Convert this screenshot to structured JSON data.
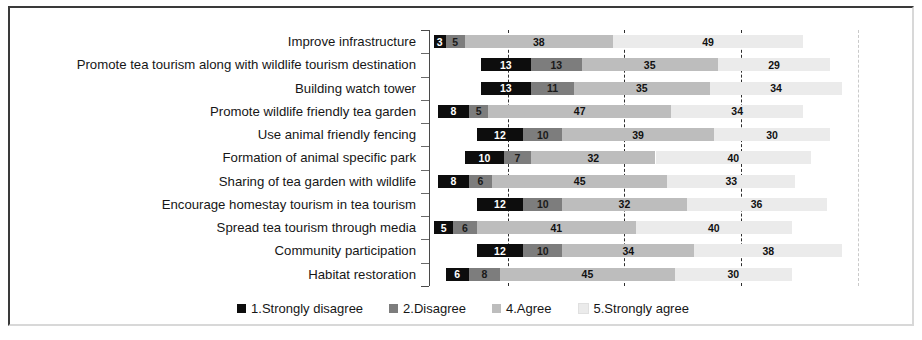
{
  "chart_data": {
    "type": "bar",
    "subtype": "stacked-horizontal",
    "title": "",
    "xlabel": "",
    "ylabel": "",
    "grid": true,
    "legend_position": "bottom",
    "xlim": [
      0,
      100
    ],
    "categories": [
      "Improve infrastructure",
      "Promote tea tourism along with wildlife tourism destination",
      "Building watch tower",
      "Promote wildlife friendly tea garden",
      "Use animal friendly fencing",
      "Formation of animal specific park",
      "Sharing of tea garden with wildlife",
      "Encourage homestay tourism in tea tourism",
      "Spread tea tourism through media",
      "Community participation",
      "Habitat restoration"
    ],
    "series": [
      {
        "name": "1.Strongly disagree",
        "color": "#0d0d0d",
        "values": [
          3,
          13,
          13,
          8,
          12,
          10,
          8,
          12,
          5,
          12,
          6
        ]
      },
      {
        "name": "2.Disagree",
        "color": "#7d7d7d",
        "values": [
          5,
          13,
          11,
          5,
          10,
          7,
          6,
          10,
          6,
          10,
          8
        ]
      },
      {
        "name": "4.Agree",
        "color": "#bdbdbd",
        "values": [
          38,
          35,
          35,
          47,
          39,
          32,
          45,
          32,
          41,
          34,
          45
        ]
      },
      {
        "name": "5.Strongly agree",
        "color": "#ebebeb",
        "values": [
          49,
          29,
          34,
          34,
          30,
          40,
          33,
          36,
          40,
          38,
          30
        ]
      }
    ],
    "bar_offsets": [
      1,
      13,
      13,
      2,
      12,
      9,
      2,
      12,
      1,
      12,
      4
    ]
  },
  "legend": {
    "items": [
      {
        "label": "1.Strongly disagree",
        "color": "#0d0d0d"
      },
      {
        "label": "2.Disagree",
        "color": "#7d7d7d"
      },
      {
        "label": "4.Agree",
        "color": "#bdbdbd"
      },
      {
        "label": "5.Strongly agree",
        "color": "#ebebeb"
      }
    ]
  }
}
